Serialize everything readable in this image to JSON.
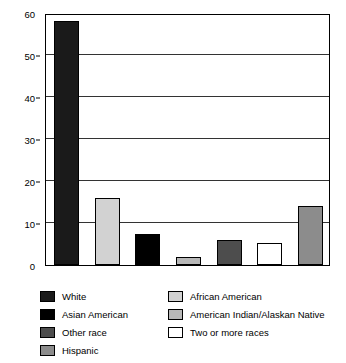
{
  "chart_data": {
    "type": "bar",
    "title": "",
    "xlabel": "",
    "ylabel": "PERCENT OF ALL ADOPTED CHILDREN",
    "ylim": [
      0,
      60
    ],
    "ytick_labels": [
      "0",
      "10",
      "20",
      "30",
      "40",
      "50",
      "60"
    ],
    "ytick_values": [
      0,
      10,
      20,
      30,
      40,
      50,
      60
    ],
    "grid": true,
    "legend_position": "bottom",
    "categories": [
      "White",
      "African American",
      "Asian American",
      "American Indian/Alaskan Native",
      "Other race",
      "Two or more races",
      "Hispanic"
    ],
    "values": [
      58,
      16,
      7.5,
      2,
      6,
      5.3,
      14
    ],
    "colors": [
      "#1a1a1a",
      "#d2d2d2",
      "#000000",
      "#b8b8b8",
      "#4d4d4d",
      "#ffffff",
      "#8c8c8c"
    ],
    "bars": [
      {
        "label": "White",
        "value": 58,
        "color": "#1a1a1a"
      },
      {
        "label": "African American",
        "value": 16,
        "color": "#d2d2d2"
      },
      {
        "label": "Asian American",
        "value": 7.5,
        "color": "#000000"
      },
      {
        "label": "American Indian/Alaskan Native",
        "value": 2,
        "color": "#b8b8b8"
      },
      {
        "label": "Other race",
        "value": 6,
        "color": "#4d4d4d"
      },
      {
        "label": "Two or more races",
        "value": 5.3,
        "color": "#ffffff"
      },
      {
        "label": "Hispanic",
        "value": 14,
        "color": "#8c8c8c"
      }
    ]
  },
  "legend": {
    "left_column": [
      {
        "label": "White",
        "color": "#1a1a1a"
      },
      {
        "label": "Asian American",
        "color": "#000000"
      },
      {
        "label": "Other race",
        "color": "#4d4d4d"
      },
      {
        "label": "Hispanic",
        "color": "#8c8c8c"
      }
    ],
    "right_column": [
      {
        "label": "African American",
        "color": "#d2d2d2"
      },
      {
        "label": "American Indian/Alaskan Native",
        "color": "#b8b8b8"
      },
      {
        "label": "Two or more races",
        "color": "#ffffff"
      }
    ]
  }
}
